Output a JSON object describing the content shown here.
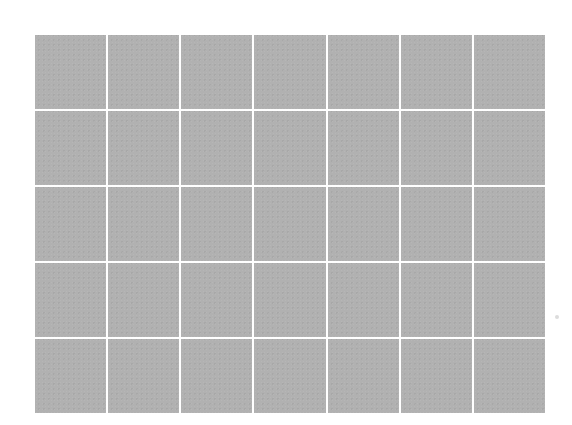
{
  "grid": {
    "columns": 7,
    "rows": 5,
    "cell_color": "#b1b1b1",
    "line_color": "#ffffff",
    "background_color": "#ffffff"
  }
}
